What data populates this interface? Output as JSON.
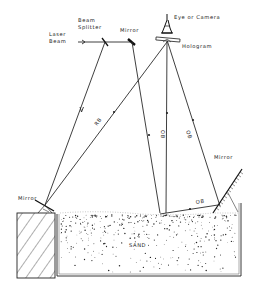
{
  "diagram": {
    "labels": {
      "laser_beam_line1": "Laser",
      "laser_beam_line2": "Beam",
      "beam_splitter_line1": "Beam",
      "beam_splitter_line2": "Splitter",
      "top_mirror": "Mirror",
      "eye_or_camera": "Eye or Camera",
      "hologram": "Hologram",
      "left_mirror": "Mirror",
      "right_mirror": "Mirror",
      "sand": "SAND",
      "rb": "RB",
      "ob_center": "OB",
      "ob_right": "OB",
      "ob_bottom": "OB"
    },
    "components": [
      {
        "name": "Laser Beam",
        "position": [
          80,
          42
        ]
      },
      {
        "name": "Beam Splitter",
        "position": [
          105,
          42
        ]
      },
      {
        "name": "Mirror (top)",
        "position": [
          132,
          42
        ]
      },
      {
        "name": "Eye or Camera",
        "position": [
          167,
          15
        ]
      },
      {
        "name": "Hologram",
        "position": [
          167,
          40
        ]
      },
      {
        "name": "Mirror (left)",
        "position": [
          45,
          205
        ]
      },
      {
        "name": "Mirror (right)",
        "position": [
          228,
          192
        ]
      },
      {
        "name": "Sand box",
        "position": [
          57,
          213
        ]
      }
    ],
    "beams": [
      {
        "label": "",
        "from": "Laser Beam",
        "to": "Beam Splitter"
      },
      {
        "label": "",
        "from": "Beam Splitter",
        "to": "Mirror (top)"
      },
      {
        "label": "",
        "from": "Beam Splitter",
        "to": "Mirror (left)"
      },
      {
        "label": "RB",
        "from": "Mirror (left)",
        "to": "Hologram"
      },
      {
        "label": "",
        "from": "Mirror (top)",
        "to": "Sand"
      },
      {
        "label": "OB",
        "from": "Sand",
        "to": "Hologram"
      },
      {
        "label": "OB",
        "from": "Sand",
        "to": "Mirror (right)"
      },
      {
        "label": "OB",
        "from": "Mirror (right)",
        "to": "Hologram"
      }
    ]
  }
}
